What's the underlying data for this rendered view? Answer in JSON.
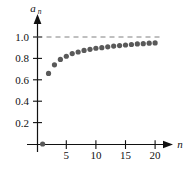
{
  "chart_data": {
    "type": "scatter",
    "title": "",
    "subtitle": "",
    "xlabel": "n",
    "ylabel": "a_n",
    "ylabel_base": "a",
    "ylabel_sub": "n",
    "xlim": [
      0,
      22
    ],
    "ylim": [
      0,
      1.1
    ],
    "grid": false,
    "legend": null,
    "x": [
      1,
      2,
      3,
      4,
      5,
      6,
      7,
      8,
      9,
      10,
      11,
      12,
      13,
      14,
      15,
      16,
      17,
      18,
      19,
      20
    ],
    "values": [
      0.0,
      0.66,
      0.74,
      0.79,
      0.82,
      0.845,
      0.86,
      0.875,
      0.885,
      0.895,
      0.9,
      0.908,
      0.915,
      0.92,
      0.925,
      0.93,
      0.935,
      0.938,
      0.942,
      0.945
    ],
    "series": [
      {
        "name": "a_n",
        "marker": "filled-circle",
        "color": "#595959",
        "values": [
          0.0,
          0.66,
          0.74,
          0.79,
          0.82,
          0.845,
          0.86,
          0.875,
          0.885,
          0.895,
          0.9,
          0.908,
          0.915,
          0.92,
          0.925,
          0.93,
          0.935,
          0.938,
          0.942,
          0.945
        ]
      }
    ],
    "xticks": [
      5,
      10,
      15,
      20
    ],
    "xtick_labels": [
      "5",
      "10",
      "15",
      "20"
    ],
    "yticks": [
      0.2,
      0.4,
      0.6,
      0.8,
      1.0
    ],
    "ytick_labels": [
      "0.2",
      "0.4",
      "0.6",
      "0.8",
      "1.0"
    ],
    "asymptote": {
      "value": 1.0,
      "label": "",
      "style": "dashed",
      "color": "#808080"
    },
    "axis_color": "#111111",
    "marker_color": "#595959",
    "arrow_x": true,
    "arrow_y": true
  },
  "caption": ""
}
